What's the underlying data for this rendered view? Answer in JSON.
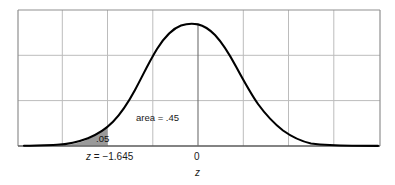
{
  "figure": {
    "title": "",
    "axis_label": "z",
    "annotations": {
      "area_label": "area = .45",
      "tail_area_label": ".05",
      "critical_value_label": "z = −1.645",
      "center_label": "0"
    },
    "colors": {
      "curve": "#000000",
      "grid": "#b8b8b8",
      "frame": "#8c8c8c",
      "shaded_region": "#999999",
      "text": "#1a1a1a",
      "background": "#ffffff"
    }
  },
  "chart_data": {
    "type": "area",
    "title": "",
    "xlabel": "z",
    "ylabel": "",
    "grid": true,
    "legend": null,
    "xlim": [
      -4.0,
      4.0
    ],
    "ylim": [
      0,
      0.45
    ],
    "distribution": "standard normal",
    "mean": 0,
    "sd": 1,
    "x": [
      -4.0,
      -3.6,
      -3.2,
      -2.8,
      -2.4,
      -2.0,
      -1.645,
      -1.6,
      -1.2,
      -0.8,
      -0.4,
      0.0,
      0.4,
      0.8,
      1.2,
      1.6,
      2.0,
      2.4,
      2.8,
      3.2,
      3.6,
      4.0
    ],
    "y": [
      0.0001,
      0.0006,
      0.0024,
      0.0079,
      0.0224,
      0.054,
      0.1031,
      0.1109,
      0.1942,
      0.2897,
      0.3683,
      0.3989,
      0.3683,
      0.2897,
      0.1942,
      0.1109,
      0.054,
      0.0224,
      0.0079,
      0.0024,
      0.0006,
      0.0001
    ],
    "markers": [
      {
        "name": "critical-value",
        "x": -1.645,
        "label": "z = −1.645"
      },
      {
        "name": "center",
        "x": 0,
        "label": "0"
      }
    ],
    "shaded_regions": [
      {
        "name": "left-tail",
        "from": -4.0,
        "to": -1.645,
        "area": 0.05,
        "label": ".05",
        "color": "#999999"
      },
      {
        "name": "body",
        "from": -1.645,
        "to": 0.0,
        "area": 0.45,
        "label": "area = .45",
        "color": "none"
      }
    ],
    "axis_ranges": {
      "x": [
        -4.0,
        4.0
      ],
      "y": [
        0,
        0.45
      ]
    },
    "gridlines": {
      "vertical_count": 8,
      "horizontal_count": 3
    }
  }
}
